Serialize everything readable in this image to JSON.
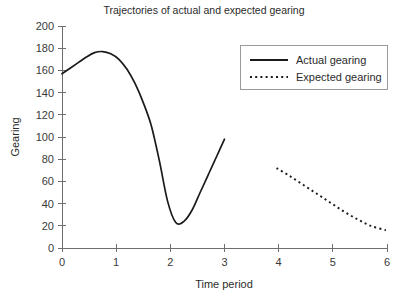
{
  "chart_data": {
    "type": "line",
    "title": "Trajectories of actual and expected gearing",
    "xlabel": "Time period",
    "ylabel": "Gearing",
    "xlim": [
      0,
      6
    ],
    "ylim": [
      0,
      200
    ],
    "xticks": [
      "0",
      "1",
      "2",
      "3",
      "4",
      "5",
      "6"
    ],
    "xtick_values": [
      0,
      1,
      2,
      3,
      4,
      5,
      6
    ],
    "yticks": [
      "0",
      "20",
      "40",
      "60",
      "80",
      "100",
      "120",
      "140",
      "160",
      "180",
      "200"
    ],
    "ytick_values": [
      0,
      20,
      40,
      60,
      80,
      100,
      120,
      140,
      160,
      180,
      200
    ],
    "grid": false,
    "legend_position": "upper right",
    "series": [
      {
        "name": "Actual gearing",
        "style": "solid",
        "color": "#1a1a1a",
        "x": [
          0.0,
          0.15,
          0.3,
          0.45,
          0.6,
          0.75,
          0.9,
          1.05,
          1.2,
          1.35,
          1.5,
          1.65,
          1.8,
          1.95,
          2.1,
          2.25,
          2.4,
          2.55,
          2.7,
          2.85,
          3.0
        ],
        "y": [
          157,
          162,
          167,
          172,
          176,
          177,
          175,
          170,
          161,
          148,
          131,
          110,
          78,
          42,
          23,
          24,
          34,
          50,
          66,
          82,
          98
        ]
      },
      {
        "name": "Expected gearing",
        "style": "dotted",
        "color": "#1a1a1a",
        "x": [
          3.96,
          4.2,
          4.45,
          4.7,
          4.95,
          5.2,
          5.45,
          5.7,
          5.98
        ],
        "y": [
          72,
          65,
          57,
          49,
          41,
          33,
          26,
          20,
          16
        ]
      }
    ]
  },
  "legend": {
    "items": [
      {
        "label": "Actual gearing",
        "style": "solid"
      },
      {
        "label": "Expected gearing",
        "style": "dotted"
      }
    ]
  }
}
